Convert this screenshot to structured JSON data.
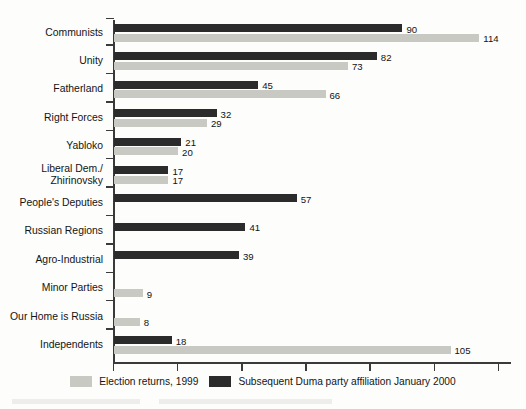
{
  "chart_data": {
    "type": "bar",
    "orientation": "horizontal",
    "title": "",
    "subtitle": "",
    "xlabel": "",
    "ylabel": "",
    "grid": false,
    "legend_position": "bottom-center",
    "xlim": [
      0,
      124
    ],
    "x_tick_values": [
      0,
      20,
      40,
      60,
      80,
      100,
      120
    ],
    "x_tick_labels": [
      "",
      "",
      "",
      "",
      "",
      "",
      ""
    ],
    "categories": [
      "Communists",
      "Unity",
      "Fatherland",
      "Right Forces",
      "Yabloko",
      "Liberal Dem./\nZhirinovsky",
      "People's Deputies",
      "Russian Regions",
      "Agro-Industrial",
      "Minor Parties",
      "Our Home is Russia",
      "Independents"
    ],
    "series": [
      {
        "name": "Subsequent Duma party affiliation January 2000",
        "color": "#2b2b2b",
        "values": [
          90,
          82,
          45,
          32,
          21,
          17,
          57,
          41,
          39,
          null,
          null,
          18
        ],
        "labels": [
          "90",
          "82",
          "45",
          "32",
          "21",
          "17",
          "57",
          "41",
          "39",
          "",
          "",
          "18"
        ]
      },
      {
        "name": "Election returns, 1999",
        "color": "#c9c9c4",
        "values": [
          114,
          73,
          66,
          29,
          20,
          17,
          null,
          null,
          null,
          9,
          8,
          105
        ],
        "labels": [
          "114",
          "73",
          "66",
          "29",
          "20",
          "17",
          "",
          "",
          "",
          "9",
          "8",
          "105"
        ]
      }
    ]
  },
  "legend": {
    "items": [
      {
        "label": "Election returns, 1999",
        "color": "#c9c9c4",
        "swatch_name": "legend-swatch-election-returns"
      },
      {
        "label": "Subsequent Duma party affiliation January 2000",
        "color": "#2b2b2b",
        "swatch_name": "legend-swatch-duma-affiliation"
      }
    ]
  }
}
